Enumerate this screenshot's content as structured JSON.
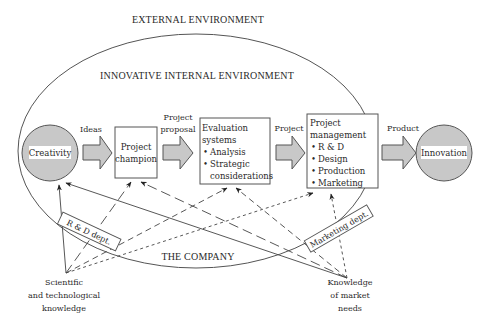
{
  "labels": {
    "external_environment": "EXTERNAL ENVIRONMENT",
    "internal_environment": "INNOVATIVE INTERNAL ENVIRONMENT",
    "the_company": "THE COMPANY"
  },
  "nodes": {
    "creativity": "Creativity",
    "innovation": "Innovation",
    "project_champion": [
      "Project",
      "champion"
    ],
    "evaluation_systems": {
      "title": [
        "Evaluation",
        "systems"
      ],
      "bullets": [
        "Analysis",
        "Strategic",
        "considerations"
      ]
    },
    "project_management": {
      "title": [
        "Project",
        "management"
      ],
      "bullets": [
        "R & D",
        "Design",
        "Production",
        "Marketing"
      ]
    }
  },
  "flow_labels": {
    "ideas": "Ideas",
    "project_proposal": [
      "Project",
      "proposal"
    ],
    "project": "Project",
    "product": "Product"
  },
  "departments": {
    "rd": "R & D dept.",
    "marketing": "Marketing dept."
  },
  "sources": {
    "scientific": [
      "Scientific",
      "and technological",
      "knowledge"
    ],
    "market": [
      "Knowledge",
      "of market",
      "needs"
    ]
  },
  "bullet_glyph": "•",
  "colors": {
    "node_fill": "#c8c8c8",
    "stroke": "#555555",
    "text": "#2a2a2a"
  }
}
